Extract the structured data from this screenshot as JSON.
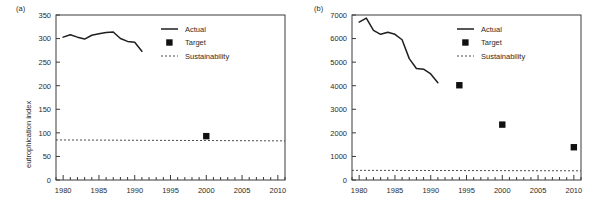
{
  "figure": {
    "panels": [
      {
        "label": "(a)",
        "ylabel": "eutrophication index",
        "legend": [
          "Actual",
          "Target",
          "Sustainability"
        ]
      },
      {
        "label": "(b)",
        "ylabel": "acidification index per hectare",
        "legend": [
          "Actual",
          "Target",
          "Sustainability"
        ]
      }
    ]
  },
  "chart_data": [
    {
      "type": "line",
      "panel": "(a)",
      "title": "",
      "xlabel": "",
      "ylabel": "eutrophication index",
      "xlim": [
        1979,
        2011
      ],
      "ylim": [
        0,
        350
      ],
      "xticks": [
        1980,
        1985,
        1990,
        1995,
        2000,
        2005,
        2010
      ],
      "xtick_labels": [
        "1980",
        "1985",
        "1990",
        "1995",
        "2000",
        "2005",
        "2010"
      ],
      "minor_xtick_interval": 1,
      "yticks": [
        0,
        50,
        100,
        150,
        200,
        250,
        300,
        350
      ],
      "ytick_labels": [
        "0",
        "50",
        "100",
        "150",
        "200",
        "250",
        "300",
        "350"
      ],
      "grid": false,
      "legend_position": "upper right",
      "series": [
        {
          "name": "Actual",
          "style": "line",
          "x": [
            1980,
            1981,
            1982,
            1983,
            1984,
            1985,
            1986,
            1987,
            1988,
            1989,
            1990,
            1991
          ],
          "values": [
            303,
            308,
            303,
            299,
            307,
            310,
            313,
            314,
            300,
            294,
            292,
            273
          ]
        },
        {
          "name": "Target",
          "style": "marker",
          "x": [
            2000
          ],
          "values": [
            93
          ]
        },
        {
          "name": "Sustainability",
          "style": "dashed-line",
          "x": [
            1979,
            2011
          ],
          "values": [
            85,
            83
          ]
        }
      ]
    },
    {
      "type": "line",
      "panel": "(b)",
      "title": "",
      "xlabel": "",
      "ylabel": "acidification index per hectare",
      "xlim": [
        1979,
        2011
      ],
      "ylim": [
        0,
        7000
      ],
      "xticks": [
        1980,
        1985,
        1990,
        1995,
        2000,
        2005,
        2010
      ],
      "xtick_labels": [
        "1980",
        "1985",
        "1990",
        "1995",
        "2000",
        "2005",
        "2010"
      ],
      "minor_xtick_interval": 1,
      "yticks": [
        0,
        1000,
        2000,
        3000,
        4000,
        5000,
        6000,
        7000
      ],
      "ytick_labels": [
        "0",
        "1000",
        "2000",
        "3000",
        "4000",
        "5000",
        "6000",
        "7000"
      ],
      "grid": false,
      "legend_position": "upper right",
      "series": [
        {
          "name": "Actual",
          "style": "line",
          "x": [
            1980,
            1981,
            1982,
            1983,
            1984,
            1985,
            1986,
            1987,
            1988,
            1989,
            1990,
            1991
          ],
          "values": [
            6700,
            6870,
            6350,
            6180,
            6270,
            6180,
            5950,
            5150,
            4730,
            4700,
            4500,
            4130
          ]
        },
        {
          "name": "Target",
          "style": "marker",
          "x": [
            1994,
            2000,
            2010
          ],
          "values": [
            4020,
            2350,
            1390
          ]
        },
        {
          "name": "Sustainability",
          "style": "dashed-line",
          "x": [
            1979,
            2011
          ],
          "values": [
            410,
            390
          ]
        }
      ]
    }
  ]
}
